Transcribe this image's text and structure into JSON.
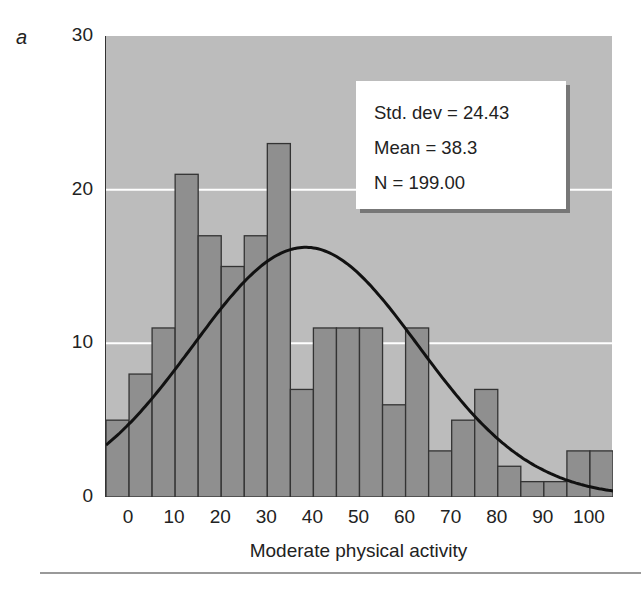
{
  "panel_label": "a",
  "chart_data": {
    "type": "bar",
    "subtype": "histogram_with_normal_curve",
    "title": "",
    "xlabel": "Moderate physical activity",
    "ylabel": "",
    "ylim": [
      0,
      30
    ],
    "xlim": [
      -5,
      105
    ],
    "bin_width": 5,
    "yticks": [
      0,
      10,
      20,
      30
    ],
    "xticks": [
      0,
      10,
      20,
      30,
      40,
      50,
      60,
      70,
      80,
      90,
      100
    ],
    "bin_starts": [
      -5,
      0,
      5,
      10,
      15,
      20,
      25,
      30,
      35,
      40,
      45,
      50,
      55,
      60,
      65,
      70,
      75,
      80,
      85,
      90,
      95,
      100
    ],
    "values": [
      5,
      8,
      11,
      21,
      17,
      15,
      17,
      23,
      7,
      11,
      11,
      11,
      6,
      11,
      3,
      5,
      7,
      2,
      1,
      1,
      3,
      3
    ],
    "grid": {
      "horizontal": true,
      "color": "#ffffff"
    },
    "normal_curve": {
      "mean": 38.3,
      "std_dev": 24.43,
      "n": 199
    },
    "legend": {
      "position": "upper-right",
      "lines": [
        "Std. dev = 24.43",
        "Mean = 38.3",
        "N = 199.00"
      ]
    }
  },
  "colors": {
    "plot_bg": "#bcbcbc",
    "bar": "#8f8f8f",
    "bar_edge": "#333333",
    "curve": "#111111",
    "grid": "#ffffff"
  }
}
